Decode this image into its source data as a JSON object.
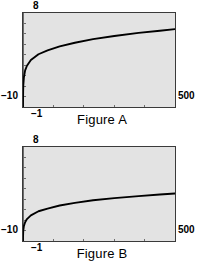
{
  "figures": [
    {
      "caption": "Figure A",
      "axis": {
        "y_top_label": "8",
        "y_bottom_label": "−10",
        "x_right_label": "500",
        "x_left_label": "−1"
      },
      "chart_data": {
        "type": "line",
        "title": "Figure A",
        "xlabel": "",
        "ylabel": "",
        "xlim": [
          -1,
          500
        ],
        "ylim": [
          -10,
          8
        ],
        "grid": false,
        "legend": "none",
        "x_ticks": [
          100,
          200,
          300,
          400
        ],
        "y_ticks": [
          -8,
          -6,
          -4,
          -2,
          0,
          2,
          4,
          6
        ],
        "x_tick_labels": [
          "",
          "",
          "",
          ""
        ],
        "y_tick_labels": [
          "",
          "",
          "",
          "",
          "",
          "",
          "",
          ""
        ],
        "series": [
          {
            "name": "curve-a",
            "x": [
              -1,
              -0.9,
              -0.5,
              0,
              2,
              6,
              12,
              25,
              50,
              80,
              120,
              170,
              230,
              300,
              380,
              450,
              500
            ],
            "y": [
              -10,
              -8.6,
              -7.0,
              -5.8,
              -4.3,
              -3.0,
              -2.1,
              -1.0,
              0.1,
              0.85,
              1.6,
              2.3,
              3.0,
              3.6,
              4.2,
              4.6,
              4.9
            ]
          }
        ]
      }
    },
    {
      "caption": "Figure B",
      "axis": {
        "y_top_label": "8",
        "y_bottom_label": "−10",
        "x_right_label": "500",
        "x_left_label": "−1"
      },
      "chart_data": {
        "type": "line",
        "title": "Figure B",
        "xlabel": "",
        "ylabel": "",
        "xlim": [
          -1,
          500
        ],
        "ylim": [
          -10,
          8
        ],
        "grid": false,
        "legend": "none",
        "x_ticks": [
          100,
          200,
          300,
          400
        ],
        "y_ticks": [
          -8,
          -6,
          -4,
          -2,
          0,
          2,
          4,
          6
        ],
        "x_tick_labels": [
          "",
          "",
          "",
          ""
        ],
        "y_tick_labels": [
          "",
          "",
          "",
          "",
          "",
          "",
          "",
          ""
        ],
        "series": [
          {
            "name": "curve-b",
            "x": [
              -1,
              -0.9,
              -0.5,
              0,
              2,
              6,
              12,
              25,
              50,
              80,
              120,
              170,
              230,
              300,
              380,
              450,
              500
            ],
            "y": [
              -10,
              -9.3,
              -8.5,
              -7.9,
              -7.1,
              -6.4,
              -5.8,
              -5.1,
              -4.3,
              -3.8,
              -3.2,
              -2.7,
              -2.2,
              -1.8,
              -1.4,
              -1.1,
              -0.9
            ]
          }
        ]
      }
    }
  ],
  "colors": {
    "plot_background": "#e3e3e3",
    "plot_border": "#3a3a3a",
    "curve": "#000000",
    "axis_line": "#6b6b6b",
    "tick": "#6b6b6b",
    "page_background": "#ffffff",
    "text": "#000000"
  }
}
